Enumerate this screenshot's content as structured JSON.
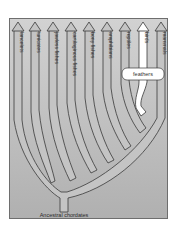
{
  "diagram": {
    "type": "phylogenetic-tree",
    "root_label": "Ancestral chordates",
    "taxa": [
      {
        "label": "lancelets"
      },
      {
        "label": "tunicates"
      },
      {
        "label": "jawless fishes"
      },
      {
        "label": "cartilaginous fishes"
      },
      {
        "label": "bony fishes"
      },
      {
        "label": "amphibians"
      },
      {
        "label": "reptiles"
      },
      {
        "label": "birds"
      },
      {
        "label": "mammals"
      }
    ],
    "traits": [
      {
        "label": "feathers",
        "applies_to": "birds"
      }
    ],
    "colors": {
      "background": "#b4b4b4",
      "background_top": "#cfcfcf",
      "branch_fill": "#c6c6c6",
      "branch_stroke": "#3a3a3a",
      "highlight_branch": "#ffffff",
      "frame": "#6e6e6e"
    }
  }
}
